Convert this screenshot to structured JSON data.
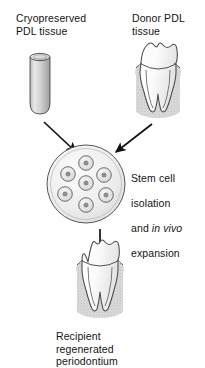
{
  "figure": {
    "background_color": "#ffffff",
    "line_color": "#3a3a3a",
    "arrow_color": "#111111",
    "fill_light": "#f2f2f2",
    "fill_mid": "#d2d2d2",
    "fill_dark": "#9a9a9a"
  },
  "labels": {
    "cryopreserved": "Cryopreserved\nPDL tissue",
    "donor": "Donor PDL\ntissue",
    "stem_line1": "Stem cell",
    "stem_line2": "isolation",
    "stem_line3_pre": "and ",
    "stem_line3_italic": "in vivo",
    "stem_line4": "expansion",
    "recipient": "Recipient\nregenerated\nperiodontium"
  },
  "elements": {
    "vial": "cryovial-cylinder",
    "donor_tooth": "molar-tooth-with-periodontium",
    "culture_dish": "cell-culture-dish",
    "recipient_tooth": "molar-tooth-regenerated-periodontium",
    "arrow_left": "arrow-vial-to-dish",
    "arrow_right": "arrow-tooth-to-dish",
    "arrow_down": "arrow-dish-to-recipient-tooth"
  },
  "culture_dish": {
    "cell_count": 7,
    "cells": [
      {
        "cx": 86,
        "cy": 163
      },
      {
        "cx": 68,
        "cy": 174
      },
      {
        "cx": 104,
        "cy": 175
      },
      {
        "cx": 86,
        "cy": 183
      },
      {
        "cx": 65,
        "cy": 194
      },
      {
        "cx": 106,
        "cy": 195
      },
      {
        "cx": 86,
        "cy": 205
      }
    ]
  }
}
